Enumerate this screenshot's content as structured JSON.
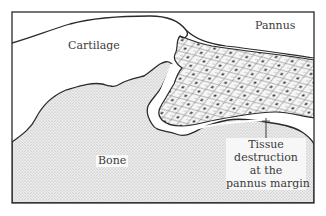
{
  "diagram": {
    "labels": {
      "cartilage": "Cartilage",
      "pannus": "Pannus",
      "bone": "Bone",
      "tissue_destruction": [
        "Tissue",
        "destruction",
        "at the",
        "pannus margin"
      ]
    },
    "colors": {
      "outline": "#2a2a2a",
      "bone_fill": "#e8e8e8",
      "bone_stipple": "#b0b0b0",
      "pannus_fill": "#f4f4f4",
      "cell_nucleus": "#3a3a3a",
      "text": "#3a3a3a"
    }
  }
}
